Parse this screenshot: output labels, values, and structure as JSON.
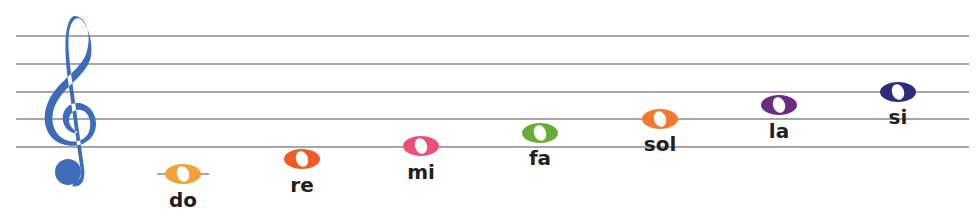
{
  "clef": {
    "name": "treble-clef",
    "color": "#3d6cb8"
  },
  "staff": {
    "line_color": "#8a8a8a",
    "lines_y": [
      36,
      64,
      92,
      119,
      147
    ],
    "x_start": 16,
    "x_end": 969
  },
  "notes": [
    {
      "name": "do",
      "color": "#f4a13a",
      "cx": 183,
      "cy": 174,
      "label_x": 183,
      "label_y": 200,
      "ledger": true
    },
    {
      "name": "re",
      "color": "#f05a24",
      "cx": 302,
      "cy": 159,
      "label_x": 302,
      "label_y": 185,
      "ledger": false
    },
    {
      "name": "mi",
      "color": "#ec5077",
      "cx": 421,
      "cy": 146,
      "label_x": 421,
      "label_y": 172,
      "ledger": false
    },
    {
      "name": "fa",
      "color": "#6aac3c",
      "cx": 540,
      "cy": 133,
      "label_x": 540,
      "label_y": 158,
      "ledger": false
    },
    {
      "name": "sol",
      "color": "#f47a30",
      "cx": 660,
      "cy": 119,
      "label_x": 660,
      "label_y": 144,
      "ledger": false
    },
    {
      "name": "la",
      "color": "#6b2d7f",
      "cx": 779,
      "cy": 105,
      "label_x": 779,
      "label_y": 131,
      "ledger": false
    },
    {
      "name": "si",
      "color": "#2e2d7a",
      "cx": 898,
      "cy": 92,
      "label_x": 898,
      "label_y": 117,
      "ledger": false
    }
  ]
}
